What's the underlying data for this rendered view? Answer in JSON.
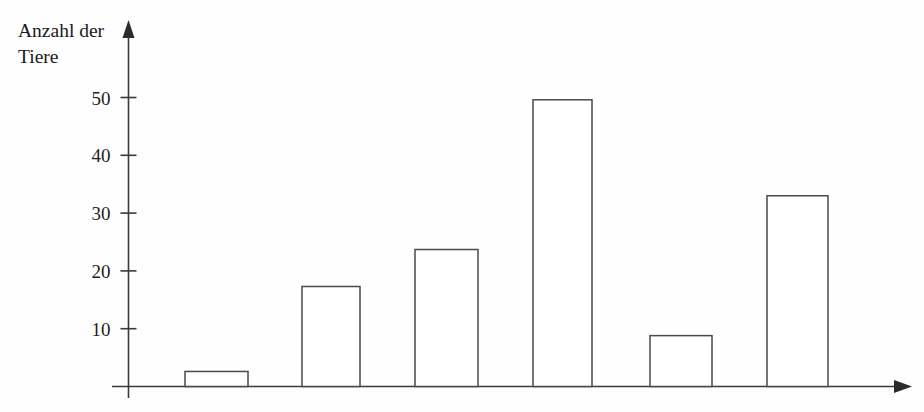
{
  "chart_data": {
    "type": "bar",
    "title": "",
    "subtitle": "",
    "xlabel": "",
    "ylabel": "Anzahl der\nTiere",
    "ylim": [
      0,
      55
    ],
    "yticks": [
      10,
      20,
      30,
      40,
      50
    ],
    "ytick_labels": [
      "10",
      "20",
      "30",
      "40",
      "50"
    ],
    "grid": false,
    "legend": false,
    "legend_position": "none",
    "categories": [
      "1",
      "2",
      "3",
      "4",
      "5",
      "6"
    ],
    "category_labels_shown": false,
    "values": [
      2.6,
      17.3,
      23.7,
      49.6,
      8.8,
      33.0
    ],
    "bar_style": {
      "fill": "#ffffff",
      "stroke": "#4a4a4a",
      "stroke_width": 1.5
    },
    "axis_style": {
      "color": "#3a3a3a",
      "arrow_x": true,
      "arrow_y": true
    }
  },
  "axes": {
    "y_title": "Anzahl der\nTiere",
    "y_tick_labels": [
      "50",
      "40",
      "30",
      "20",
      "10"
    ]
  },
  "colors": {
    "background": "#fefefe",
    "ink": "#1a1a1a",
    "axis": "#3a3a3a",
    "bar_stroke": "#4a4a4a",
    "bar_fill": "#ffffff"
  }
}
